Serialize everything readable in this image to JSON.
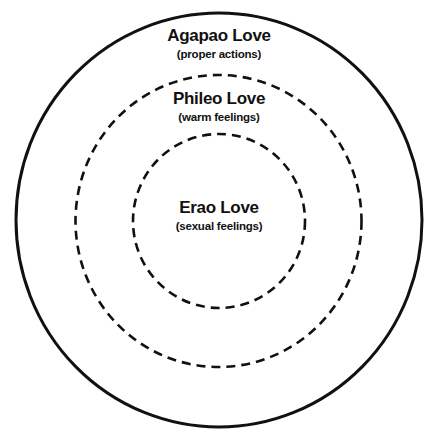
{
  "diagram": {
    "type": "concentric-circles",
    "colors": {
      "background": "#ffffff",
      "stroke": "#111111",
      "text": "#111111"
    },
    "rings": [
      {
        "name": "Agapao Love",
        "description": "(proper actions)",
        "style": "solid"
      },
      {
        "name": "Phileo Love",
        "description": "(warm feelings)",
        "style": "dashed"
      },
      {
        "name": "Erao Love",
        "description": "(sexual feelings)",
        "style": "dashed"
      }
    ]
  }
}
